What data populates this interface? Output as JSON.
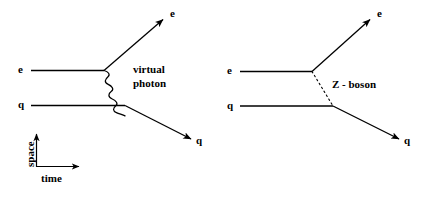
{
  "figure": {
    "background_color": "#ffffff",
    "line_color": "#000000",
    "width": 431,
    "height": 197
  },
  "diagrams": [
    {
      "id": "left",
      "name": "virtual-photon-exchange",
      "mediator": {
        "name": "virtual photon",
        "label_line1": "virtual",
        "label_line2": "photon",
        "style": "wavy"
      },
      "incoming": [
        {
          "name": "electron-in",
          "label": "e"
        },
        {
          "name": "quark-in",
          "label": "q"
        }
      ],
      "outgoing": [
        {
          "name": "electron-out",
          "label": "e"
        },
        {
          "name": "quark-out",
          "label": "q"
        }
      ]
    },
    {
      "id": "right",
      "name": "z-boson-exchange",
      "mediator": {
        "name": "Z boson",
        "label": "Z - boson",
        "style": "dotted"
      },
      "incoming": [
        {
          "name": "electron-in",
          "label": "e"
        },
        {
          "name": "quark-in",
          "label": "q"
        }
      ],
      "outgoing": [
        {
          "name": "electron-out",
          "label": "e"
        },
        {
          "name": "quark-out",
          "label": "q"
        }
      ]
    }
  ],
  "axes": {
    "name": "space-time-axes",
    "vertical_label": "space",
    "horizontal_label": "time"
  }
}
